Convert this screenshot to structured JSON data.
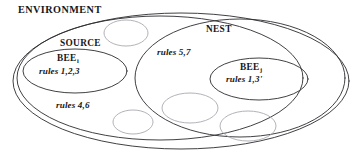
{
  "figure": {
    "type": "set-containment-diagram",
    "ink_color": "#2b2b30",
    "faint_color": "#9a9aa2",
    "background": "#ffffff",
    "labels": {
      "environment": "ENVIRONMENT",
      "source": "SOURCE",
      "nest": "NEST",
      "bee_source": "BEE",
      "bee_source_subscript": "i",
      "bee_nest": "BEE",
      "bee_nest_subscript": "j",
      "rules_bee_source": "rules 1,2,3",
      "rules_environment": "rules 4,6",
      "rules_nest": "rules 5,7",
      "rules_bee_nest": "rules 1,3'"
    },
    "regions": [
      {
        "name": "ENVIRONMENT",
        "label": "ENVIRONMENT",
        "role": "outer-set",
        "cx": 181,
        "cy": 81,
        "rx": 168,
        "ry": 68,
        "stroke": "#2b2b30",
        "contains": [
          "SOURCE",
          "NEST"
        ]
      },
      {
        "name": "SOURCE",
        "label": "SOURCE",
        "role": "inner-set",
        "cx": 160,
        "cy": 78,
        "rx": 143,
        "ry": 62,
        "stroke": "#2b2b30",
        "rules": "rules 4,6",
        "contains": [
          "BEE_i"
        ]
      },
      {
        "name": "NEST",
        "label": "NEST",
        "role": "inner-set",
        "cx": 240,
        "cy": 78,
        "rx": 105,
        "ry": 59,
        "stroke": "#2b2b30",
        "rules": "rules 5,7",
        "contains": [
          "BEE_j"
        ]
      },
      {
        "name": "BEE_i",
        "label": "BEE",
        "subscript": "i",
        "role": "agent",
        "cx": 75,
        "cy": 71,
        "rx": 52,
        "ry": 22,
        "stroke": "#2b2b30",
        "rules": "rules 1,2,3"
      },
      {
        "name": "BEE_j",
        "label": "BEE",
        "subscript": "j",
        "role": "agent",
        "cx": 259,
        "cy": 79,
        "rx": 49,
        "ry": 21,
        "stroke": "#2b2b30",
        "rules": "rules 1,3'"
      }
    ],
    "unlabeled_cells": [
      {
        "name": "cell-1",
        "cx": 126,
        "cy": 33,
        "rx": 22,
        "ry": 13
      },
      {
        "name": "cell-2",
        "cx": 133,
        "cy": 122,
        "rx": 20,
        "ry": 12
      },
      {
        "name": "cell-3",
        "cx": 190,
        "cy": 108,
        "rx": 28,
        "ry": 15
      },
      {
        "name": "cell-4",
        "cx": 248,
        "cy": 126,
        "rx": 28,
        "ry": 15
      }
    ]
  }
}
